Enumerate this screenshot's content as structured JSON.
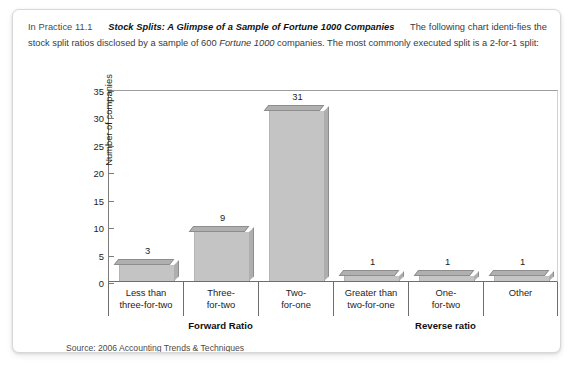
{
  "intro": {
    "lead": "In Practice 11.1",
    "title": "Stock Splits: A Glimpse of a Sample of Fortune 1000 Companies",
    "body_1": "The following chart identi-fies the stock split ratios disclosed by a sample of 600 ",
    "body_italic": "Fortune 1000",
    "body_2": " companies. The most commonly executed split is a 2-for-1 split:"
  },
  "source": "Source: 2006 Accounting Trends & Techniques",
  "groups": [
    {
      "label": "Forward Ratio"
    },
    {
      "label": "Reverse ratio"
    }
  ],
  "colors": {
    "bar_face": "#c4c4c4",
    "bar_top": "#b0b0b0",
    "bar_side": "#aeaeae",
    "axis": "#6e6e6e",
    "text": "#1c1c1c",
    "card_border": "#d8d8d8"
  },
  "chart_data": {
    "type": "bar",
    "title": "",
    "xlabel": "",
    "ylabel": "Number of companies",
    "ylim": [
      0,
      35
    ],
    "yticks": [
      0,
      5,
      10,
      15,
      20,
      25,
      30,
      35
    ],
    "grid": false,
    "legend": "none",
    "categories": [
      "Less than\nthree-for-two",
      "Three-\nfor-two",
      "Two-\nfor-one",
      "Greater than\ntwo-for-one",
      "One-\nfor-two",
      "Other"
    ],
    "values": [
      3,
      9,
      31,
      1,
      1,
      1
    ],
    "value_labels": [
      "3",
      "9",
      "31",
      "1",
      "1",
      "1"
    ],
    "group_spans": [
      {
        "label": "Forward Ratio",
        "categories": [
          0,
          1,
          2
        ]
      },
      {
        "label": "Reverse ratio",
        "categories": [
          3,
          4,
          5
        ]
      }
    ]
  }
}
